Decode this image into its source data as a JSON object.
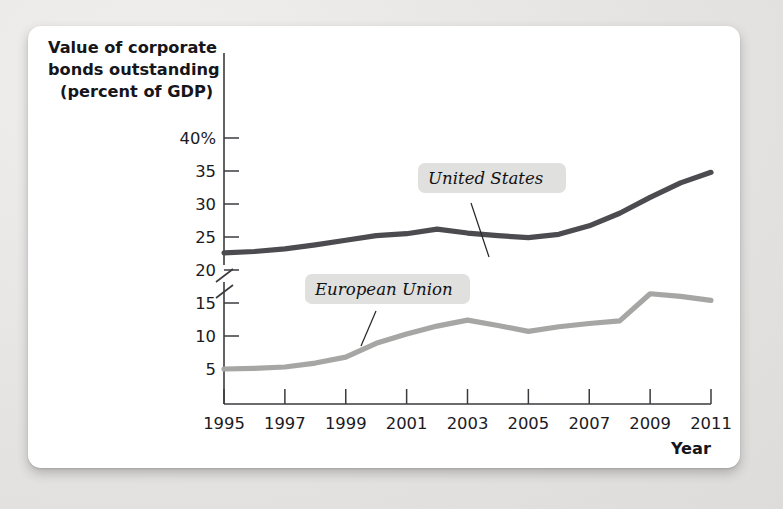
{
  "figure": {
    "axis_label_lines": [
      "Value of corporate",
      "bonds outstanding",
      "(percent of GDP)"
    ],
    "x_axis_title": "Year"
  },
  "colors": {
    "us_line": "#4c4c50",
    "eu_line": "#a6a6a4",
    "axis": "#3b3b3f",
    "chip_bg": "#e0e0de",
    "card_bg": "#ffffff",
    "page_bg": "#e6e5e3"
  },
  "chart_data": {
    "type": "line",
    "title": "Value of corporate bonds outstanding (percent of GDP)",
    "xlabel": "Year",
    "ylabel": "Value of corporate bonds outstanding (percent of GDP)",
    "x": [
      1995,
      1996,
      1997,
      1998,
      1999,
      2000,
      2001,
      2002,
      2003,
      2004,
      2005,
      2006,
      2007,
      2008,
      2009,
      2010,
      2011
    ],
    "xticks": [
      1995,
      1997,
      1999,
      2001,
      2003,
      2005,
      2007,
      2009,
      2011
    ],
    "xtick_labels": [
      "1995",
      "1997",
      "1999",
      "2001",
      "2003",
      "2005",
      "2007",
      "2009",
      "2011"
    ],
    "yticks": [
      5,
      10,
      15,
      20,
      25,
      30,
      35,
      40
    ],
    "ytick_labels": [
      "5",
      "10",
      "15",
      "20",
      "25",
      "30",
      "35",
      "40%"
    ],
    "ylim": [
      3.2,
      40
    ],
    "xlim": [
      1995,
      2011
    ],
    "axis_break": true,
    "axis_break_note": "y-axis broken below 5%",
    "grid": false,
    "legend_position": "inline-callout",
    "series": [
      {
        "name": "United States",
        "color": "#4c4c50",
        "values": [
          22.6,
          22.8,
          23.2,
          23.8,
          24.5,
          25.2,
          25.5,
          26.2,
          25.6,
          25.2,
          24.9,
          25.4,
          26.7,
          28.6,
          31.0,
          33.2,
          34.8
        ]
      },
      {
        "name": "European Union",
        "color": "#a6a6a4",
        "values": [
          5.0,
          5.1,
          5.3,
          5.9,
          6.8,
          8.9,
          10.3,
          11.5,
          12.4,
          11.6,
          10.7,
          11.4,
          11.9,
          12.3,
          16.4,
          16.0,
          15.4
        ]
      }
    ],
    "annotations": [
      {
        "text": "United States",
        "target_x": 2005,
        "target_y": 25.0
      },
      {
        "text": "European Union",
        "target_x": 2000,
        "target_y": 9.0
      }
    ]
  }
}
